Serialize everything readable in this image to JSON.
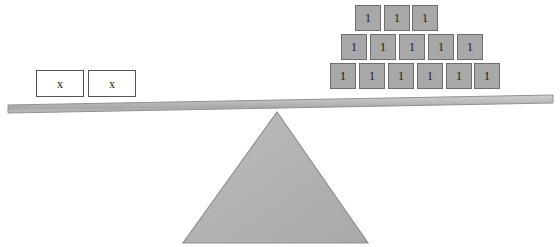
{
  "diagram": {
    "type": "balance-scale",
    "equation_left": "2x",
    "equation_right": "14",
    "colors": {
      "block_fill": "#a8a8a8",
      "block_border": "#6e6e6e",
      "beam_fill": "#b5b5b5",
      "beam_border": "#8f8f8f",
      "fulcrum_fill": "#b0b0b0",
      "fulcrum_border": "#8a8a8a",
      "box_fill": "#ffffff",
      "box_border": "#555555",
      "background": "#ffffff",
      "text": "#1a1a1a"
    }
  },
  "left_pan": {
    "name": "variable-side",
    "count": 2,
    "boxes": [
      {
        "label": "x",
        "x": 36,
        "y": 70
      },
      {
        "label": "x",
        "x": 88,
        "y": 70
      }
    ]
  },
  "right_pan": {
    "name": "constant-side",
    "count": 14,
    "rows": [
      {
        "row_index": 0,
        "y": 5,
        "blocks": [
          {
            "label": "1",
            "x": 355
          },
          {
            "label": "1",
            "x": 384
          },
          {
            "label": "1",
            "x": 412
          }
        ]
      },
      {
        "row_index": 1,
        "y": 34,
        "blocks": [
          {
            "label": "1",
            "x": 341
          },
          {
            "label": "1",
            "x": 370
          },
          {
            "label": "1",
            "x": 399
          },
          {
            "label": "1",
            "x": 428
          },
          {
            "label": "1",
            "x": 457
          }
        ]
      },
      {
        "row_index": 2,
        "y": 63,
        "blocks": [
          {
            "label": "1",
            "x": 330
          },
          {
            "label": "1",
            "x": 359
          },
          {
            "label": "1",
            "x": 388
          },
          {
            "label": "1",
            "x": 417
          },
          {
            "label": "1",
            "x": 446
          },
          {
            "label": "1",
            "x": 474
          }
        ]
      }
    ]
  },
  "beam": {
    "name": "balance-beam",
    "left_x": 8,
    "left_y": 109,
    "right_x": 553,
    "right_y": 99,
    "thickness": 8
  },
  "fulcrum": {
    "name": "fulcrum-triangle",
    "apex_x": 277,
    "apex_y": 112,
    "base_left_x": 183,
    "base_right_x": 368,
    "base_y": 243
  }
}
